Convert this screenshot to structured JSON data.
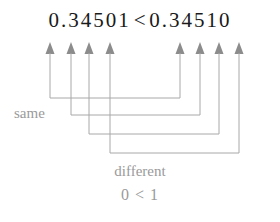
{
  "expression": {
    "left_number": "0.34501",
    "relation": "<",
    "right_number": "0.34510"
  },
  "labels": {
    "same": "same",
    "different": "different",
    "comparison": "0 < 1"
  },
  "colors": {
    "digit_text": "#1a1a1a",
    "label_text": "#9a9a9a",
    "arrow": "#8c8c8c",
    "connector": "#a8a8a8",
    "background": "#ffffff"
  },
  "arrows": {
    "left": [
      {
        "digit": "3",
        "x": 50
      },
      {
        "digit": "4",
        "x": 71
      },
      {
        "digit": "5",
        "x": 89
      },
      {
        "digit": "0",
        "x": 110
      }
    ],
    "right": [
      {
        "digit": "3",
        "x": 180
      },
      {
        "digit": "4",
        "x": 200
      },
      {
        "digit": "5",
        "x": 219
      },
      {
        "digit": "1",
        "x": 239
      }
    ]
  },
  "connectors": [
    {
      "from": "left-3",
      "to": "right-3",
      "depth_y": 98
    },
    {
      "from": "left-4",
      "to": "right-4",
      "depth_y": 115
    },
    {
      "from": "left-5",
      "to": "right-5",
      "depth_y": 134
    },
    {
      "from": "left-0",
      "to": "right-1",
      "depth_y": 153
    }
  ]
}
